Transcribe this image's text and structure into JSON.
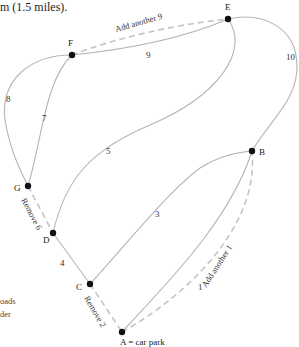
{
  "header": {
    "partial_text": "m (1.5 miles)."
  },
  "side_note": {
    "line1": "oads",
    "line2": "der"
  },
  "colors": {
    "edge": "#b5b5b5",
    "dashed_edge": "#c4c4c4",
    "node": "#111111",
    "text": "#222222"
  },
  "nodes": [
    {
      "id": "A",
      "label": "A = car park",
      "x": 122,
      "y": 332
    },
    {
      "id": "B",
      "label": "B",
      "x": 252,
      "y": 151
    },
    {
      "id": "C",
      "label": "C",
      "x": 90,
      "y": 284
    },
    {
      "id": "D",
      "label": "D",
      "x": 53,
      "y": 233
    },
    {
      "id": "E",
      "label": "E",
      "x": 228,
      "y": 19
    },
    {
      "id": "F",
      "label": "F",
      "x": 72,
      "y": 55
    },
    {
      "id": "G",
      "label": "G",
      "x": 28,
      "y": 186
    }
  ],
  "edges": [
    {
      "from": "A",
      "to": "B",
      "weight": "1"
    },
    {
      "from": "B",
      "to": "C",
      "weight": "3"
    },
    {
      "from": "C",
      "to": "D",
      "weight": "4"
    },
    {
      "from": "D",
      "to": "E",
      "weight": "5"
    },
    {
      "from": "F",
      "to": "G",
      "weight": "7",
      "note": "inner curve"
    },
    {
      "from": "F",
      "to": "G",
      "weight": "8",
      "note": "outer curve"
    },
    {
      "from": "F",
      "to": "E",
      "weight": "9"
    },
    {
      "from": "E",
      "to": "B",
      "weight": "10"
    }
  ],
  "modifications": [
    {
      "type": "add",
      "label": "Add another 9",
      "between": [
        "F",
        "E"
      ]
    },
    {
      "type": "add",
      "label": "Add another 1",
      "between": [
        "A",
        "B"
      ]
    },
    {
      "type": "remove",
      "label": "Remove 6",
      "between": [
        "G",
        "D"
      ]
    },
    {
      "type": "remove",
      "label": "Remove 2",
      "between": [
        "C",
        "A"
      ]
    }
  ]
}
